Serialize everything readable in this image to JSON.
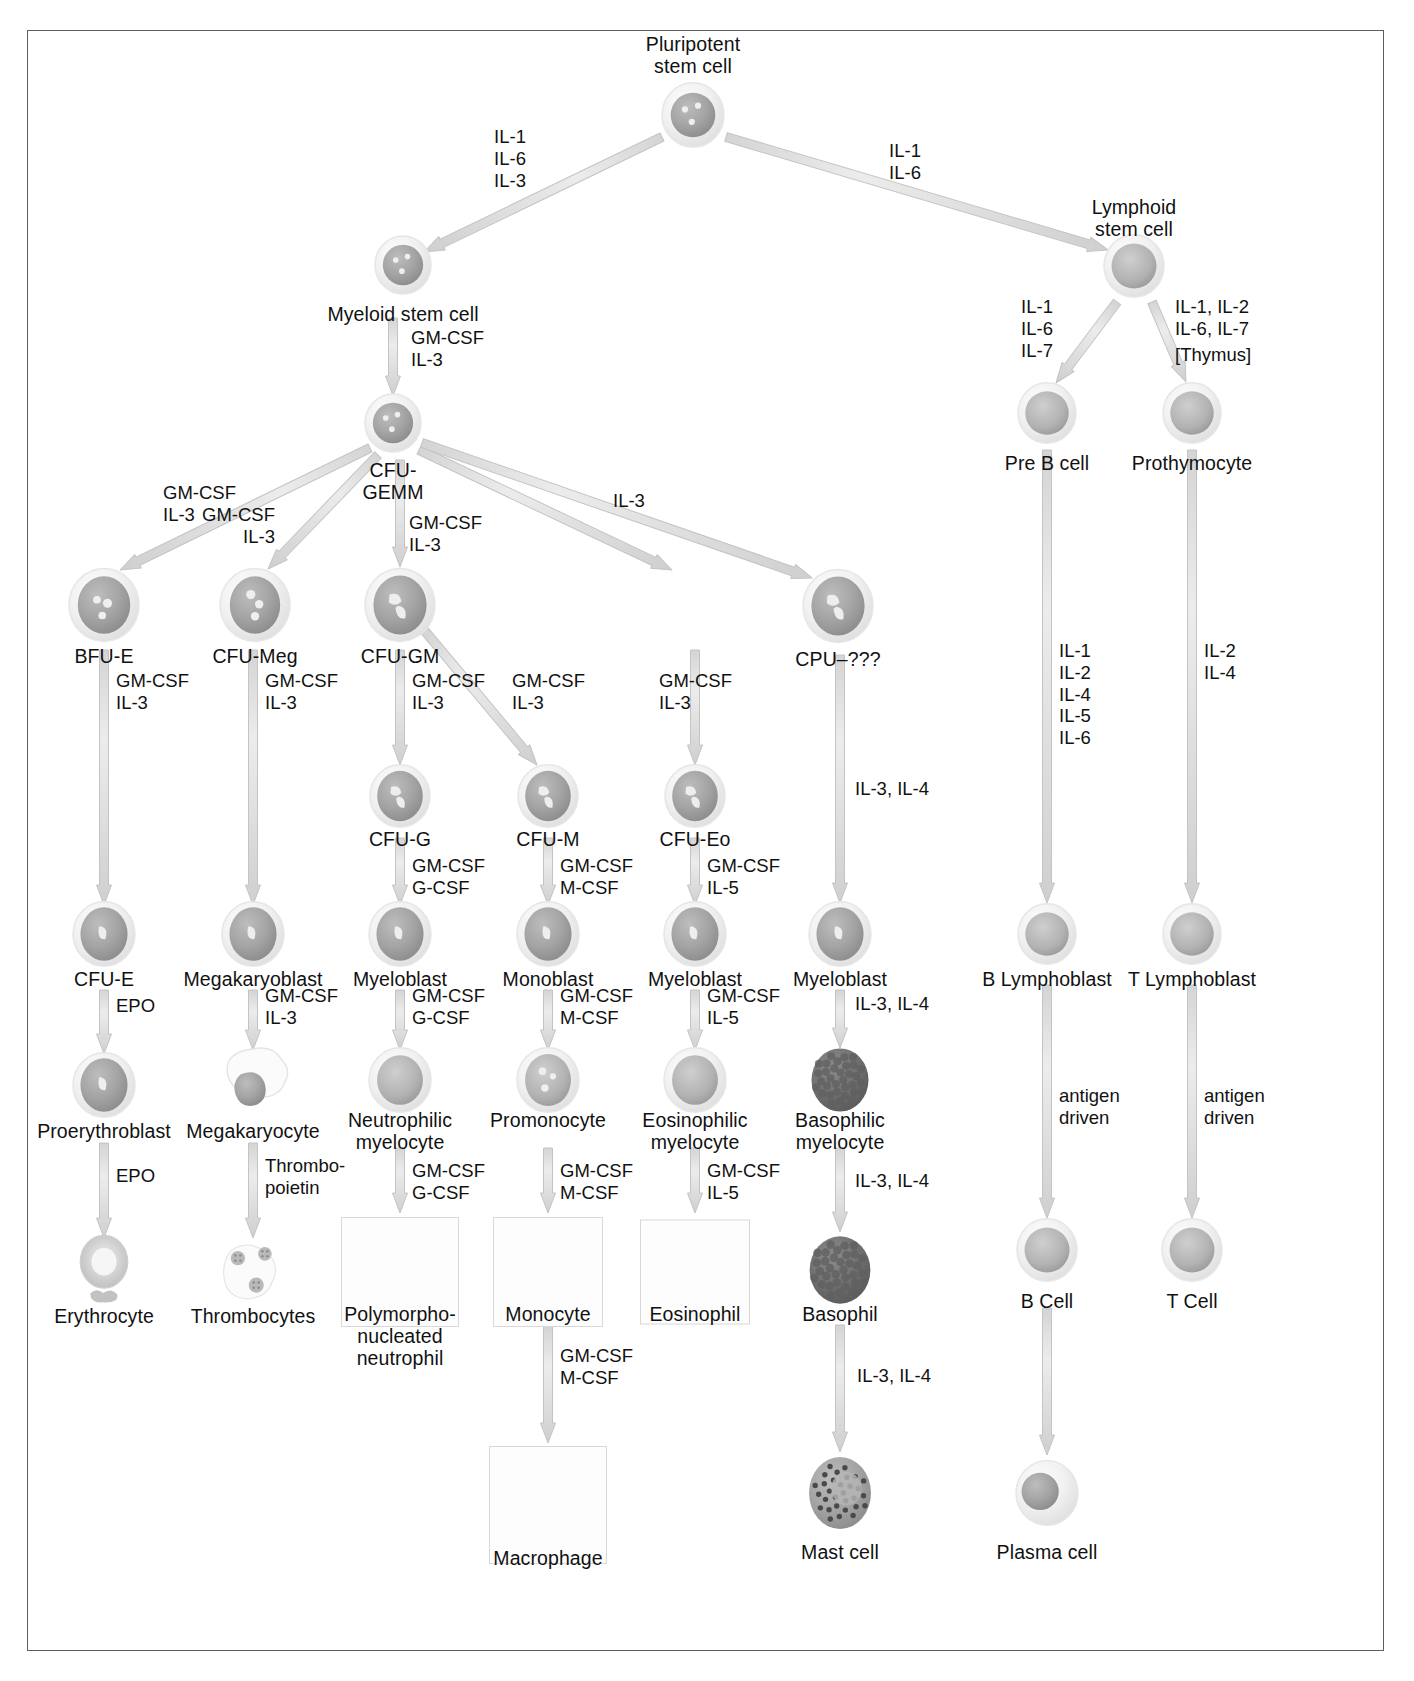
{
  "figure": {
    "frame_border_color": "#5a5f63",
    "background_color": "#ffffff"
  },
  "palette": {
    "cell_outer": "#efefef",
    "cell_ring": "#dcdcdc",
    "nucleus": "#9d9d9d",
    "nucleus_light": "#b8b8b8",
    "granule_dark": "#6e6e6e",
    "arrow_fill": "#e2e2e2",
    "arrow_stroke": "#c4c4c4",
    "text": "#111111"
  },
  "nodes": [
    {
      "id": "pluripotent",
      "label": "Pluripotent\nstem cell",
      "x": 693,
      "y": 117,
      "label_x": 693,
      "label_y": 33,
      "kind": "stem3",
      "r": 31
    },
    {
      "id": "myeloid",
      "label": "Myeloid stem cell",
      "x": 403,
      "y": 267,
      "label_x": 403,
      "label_y": 303,
      "kind": "stem3",
      "r": 28
    },
    {
      "id": "lymphoid",
      "label": "Lymphoid\nstem cell",
      "x": 1134,
      "y": 268,
      "label_x": 1134,
      "label_y": 196,
      "kind": "plain",
      "r": 30
    },
    {
      "id": "cfu-gemm",
      "label": "CFU-\nGEMM",
      "x": 393,
      "y": 425,
      "label_x": 393,
      "label_y": 459,
      "kind": "stem3",
      "r": 28
    },
    {
      "id": "pre-b",
      "label": "Pre B cell",
      "x": 1047,
      "y": 415,
      "label_x": 1047,
      "label_y": 452,
      "kind": "plain",
      "r": 29
    },
    {
      "id": "prothymocyte",
      "label": "Prothymocyte",
      "x": 1192,
      "y": 415,
      "label_x": 1192,
      "label_y": 452,
      "kind": "plain",
      "r": 29
    },
    {
      "id": "bfu-e",
      "label": "BFU-E",
      "x": 104,
      "y": 607,
      "label_x": 104,
      "label_y": 645,
      "kind": "blast2",
      "r": 35
    },
    {
      "id": "cfu-meg",
      "label": "CFU-Meg",
      "x": 255,
      "y": 607,
      "label_x": 255,
      "label_y": 645,
      "kind": "blast3",
      "r": 35
    },
    {
      "id": "cfu-gm",
      "label": "CFU-GM",
      "x": 400,
      "y": 607,
      "label_x": 400,
      "label_y": 645,
      "kind": "blastc",
      "r": 35
    },
    {
      "id": "cpu-unknown",
      "label": "CPU–???",
      "x": 838,
      "y": 608,
      "label_x": 838,
      "label_y": 648,
      "kind": "blastc",
      "r": 35
    },
    {
      "id": "cfu-g",
      "label": "CFU-G",
      "x": 400,
      "y": 798,
      "label_x": 400,
      "label_y": 828,
      "kind": "blastc",
      "r": 30
    },
    {
      "id": "cfu-m",
      "label": "CFU-M",
      "x": 548,
      "y": 798,
      "label_x": 548,
      "label_y": 828,
      "kind": "blastc",
      "r": 30
    },
    {
      "id": "cfu-eo",
      "label": "CFU-Eo",
      "x": 695,
      "y": 798,
      "label_x": 695,
      "label_y": 828,
      "kind": "blastc",
      "r": 30
    },
    {
      "id": "cfu-e",
      "label": "CFU-E",
      "x": 104,
      "y": 936,
      "label_x": 104,
      "label_y": 968,
      "kind": "blast1",
      "r": 31
    },
    {
      "id": "megakaryoblast",
      "label": "Megakaryoblast",
      "x": 253,
      "y": 936,
      "label_x": 253,
      "label_y": 968,
      "kind": "blast1",
      "r": 31
    },
    {
      "id": "myeloblast-g",
      "label": "Myeloblast",
      "x": 400,
      "y": 936,
      "label_x": 400,
      "label_y": 968,
      "kind": "blast1",
      "r": 31
    },
    {
      "id": "monoblast",
      "label": "Monoblast",
      "x": 548,
      "y": 936,
      "label_x": 548,
      "label_y": 968,
      "kind": "blast1",
      "r": 31
    },
    {
      "id": "myeloblast-eo",
      "label": "Myeloblast",
      "x": 695,
      "y": 936,
      "label_x": 695,
      "label_y": 968,
      "kind": "blast1",
      "r": 31
    },
    {
      "id": "myeloblast-ba",
      "label": "Myeloblast",
      "x": 840,
      "y": 936,
      "label_x": 840,
      "label_y": 968,
      "kind": "blast1",
      "r": 31
    },
    {
      "id": "b-lymphoblast",
      "label": "B Lymphoblast",
      "x": 1047,
      "y": 936,
      "label_x": 1047,
      "label_y": 968,
      "kind": "plain",
      "r": 29
    },
    {
      "id": "t-lymphoblast",
      "label": "T Lymphoblast",
      "x": 1192,
      "y": 936,
      "label_x": 1192,
      "label_y": 968,
      "kind": "plain",
      "r": 29
    },
    {
      "id": "proerythroblast",
      "label": "Proerythroblast",
      "x": 104,
      "y": 1087,
      "label_x": 104,
      "label_y": 1120,
      "kind": "blast1",
      "r": 31
    },
    {
      "id": "megakaryocyte",
      "label": "Megakaryocyte",
      "x": 253,
      "y": 1087,
      "label_x": 253,
      "label_y": 1120,
      "kind": "mega",
      "r": 36
    },
    {
      "id": "neutrophilic",
      "label": "Neutrophilic\nmyelocyte",
      "x": 400,
      "y": 1082,
      "label_x": 400,
      "label_y": 1109,
      "kind": "plainbig",
      "r": 31
    },
    {
      "id": "promonocyte",
      "label": "Promonocyte",
      "x": 548,
      "y": 1082,
      "label_x": 548,
      "label_y": 1109,
      "kind": "promono",
      "r": 31
    },
    {
      "id": "eosinophilic",
      "label": "Eosinophilic\nmyelocyte",
      "x": 695,
      "y": 1082,
      "label_x": 695,
      "label_y": 1109,
      "kind": "plainbig",
      "r": 31
    },
    {
      "id": "basophilic",
      "label": "Basophilic\nmyelocyte",
      "x": 840,
      "y": 1082,
      "label_x": 840,
      "label_y": 1109,
      "kind": "granular",
      "r": 31
    },
    {
      "id": "erythrocyte",
      "label": "Erythrocyte",
      "x": 104,
      "y": 1272,
      "label_x": 104,
      "label_y": 1305,
      "kind": "rbc",
      "r": 33
    },
    {
      "id": "thrombocytes",
      "label": "Thrombocytes",
      "x": 253,
      "y": 1272,
      "label_x": 253,
      "label_y": 1305,
      "kind": "platelets",
      "r": 36
    },
    {
      "id": "pmn",
      "label": "Polymorpho-\nnucleated\nneutrophil",
      "x": 400,
      "y": 1272,
      "label_x": 400,
      "label_y": 1303,
      "kind": "neutrophil",
      "r": 33
    },
    {
      "id": "monocyte",
      "label": "Monocyte",
      "x": 548,
      "y": 1272,
      "label_x": 548,
      "label_y": 1303,
      "kind": "monocyte",
      "r": 33
    },
    {
      "id": "eosinophil",
      "label": "Eosinophil",
      "x": 695,
      "y": 1272,
      "label_x": 695,
      "label_y": 1303,
      "kind": "eosinophil",
      "r": 33
    },
    {
      "id": "basophil",
      "label": "Basophil",
      "x": 840,
      "y": 1272,
      "label_x": 840,
      "label_y": 1303,
      "kind": "granular",
      "r": 33
    },
    {
      "id": "b-cell",
      "label": "B Cell",
      "x": 1047,
      "y": 1252,
      "label_x": 1047,
      "label_y": 1290,
      "kind": "plain",
      "r": 30
    },
    {
      "id": "t-cell",
      "label": "T Cell",
      "x": 1192,
      "y": 1252,
      "label_x": 1192,
      "label_y": 1290,
      "kind": "plain",
      "r": 30
    },
    {
      "id": "macrophage",
      "label": "Macrophage",
      "x": 548,
      "y": 1507,
      "label_x": 548,
      "label_y": 1547,
      "kind": "macrophage",
      "r": 38
    },
    {
      "id": "mast-cell",
      "label": "Mast cell",
      "x": 840,
      "y": 1495,
      "label_x": 840,
      "label_y": 1541,
      "kind": "mast",
      "r": 36
    },
    {
      "id": "plasma-cell",
      "label": "Plasma cell",
      "x": 1047,
      "y": 1495,
      "label_x": 1047,
      "label_y": 1541,
      "kind": "plasma",
      "r": 31
    }
  ],
  "boxes": [
    {
      "id": "box-pmn",
      "x": 400,
      "y": 1272,
      "w": 118,
      "h": 110
    },
    {
      "id": "box-monocyte",
      "x": 548,
      "y": 1272,
      "w": 110,
      "h": 110
    },
    {
      "id": "box-eosinophil",
      "x": 695,
      "y": 1272,
      "w": 110,
      "h": 105
    },
    {
      "id": "box-macrophage",
      "x": 548,
      "y": 1505,
      "w": 118,
      "h": 118
    }
  ],
  "arrows": [
    {
      "id": "a-pluri-myeloid",
      "x1": 662,
      "y1": 137,
      "x2": 424,
      "y2": 252
    },
    {
      "id": "a-pluri-lymphoid",
      "x1": 726,
      "y1": 137,
      "x2": 1108,
      "y2": 250
    },
    {
      "id": "a-myeloid-gemm",
      "x1": 393,
      "y1": 318,
      "x2": 393,
      "y2": 396
    },
    {
      "id": "a-lymph-preb",
      "x1": 1117,
      "y1": 302,
      "x2": 1056,
      "y2": 383
    },
    {
      "id": "a-lymph-prothy",
      "x1": 1152,
      "y1": 302,
      "x2": 1186,
      "y2": 382
    },
    {
      "id": "a-gemm-bfue",
      "x1": 370,
      "y1": 448,
      "x2": 120,
      "y2": 570
    },
    {
      "id": "a-gemm-cfumeg",
      "x1": 378,
      "y1": 455,
      "x2": 268,
      "y2": 569
    },
    {
      "id": "a-gemm-cfugm",
      "x1": 400,
      "y1": 460,
      "x2": 400,
      "y2": 567
    },
    {
      "id": "a-gemm-eo",
      "x1": 419,
      "y1": 450,
      "x2": 672,
      "y2": 570
    },
    {
      "id": "a-gemm-cpu",
      "x1": 422,
      "y1": 443,
      "x2": 812,
      "y2": 578
    },
    {
      "id": "a-cfugm-cfug",
      "x1": 400,
      "y1": 650,
      "x2": 400,
      "y2": 765
    },
    {
      "id": "a-cfugm-cfum",
      "x1": 424,
      "y1": 630,
      "x2": 537,
      "y2": 765
    },
    {
      "id": "a-cfueo-sub",
      "x1": 695,
      "y1": 650,
      "x2": 695,
      "y2": 765
    },
    {
      "id": "a-bfue-cfue",
      "x1": 104,
      "y1": 650,
      "x2": 104,
      "y2": 905
    },
    {
      "id": "a-cfumeg-megablast",
      "x1": 253,
      "y1": 650,
      "x2": 253,
      "y2": 905
    },
    {
      "id": "a-cfug-myeloblast",
      "x1": 400,
      "y1": 838,
      "x2": 400,
      "y2": 905
    },
    {
      "id": "a-cfum-monoblast",
      "x1": 548,
      "y1": 838,
      "x2": 548,
      "y2": 905
    },
    {
      "id": "a-cfueo-myeloblast",
      "x1": 695,
      "y1": 838,
      "x2": 695,
      "y2": 905
    },
    {
      "id": "a-cpu-myeloblast",
      "x1": 840,
      "y1": 655,
      "x2": 840,
      "y2": 903
    },
    {
      "id": "a-preb-blympho",
      "x1": 1047,
      "y1": 450,
      "x2": 1047,
      "y2": 903
    },
    {
      "id": "a-prothy-tlympho",
      "x1": 1192,
      "y1": 450,
      "x2": 1192,
      "y2": 903
    },
    {
      "id": "a-cfue-proery",
      "x1": 104,
      "y1": 990,
      "x2": 104,
      "y2": 1054
    },
    {
      "id": "a-megablast-megacyte",
      "x1": 253,
      "y1": 990,
      "x2": 253,
      "y2": 1050
    },
    {
      "id": "a-myeloblast-neutro",
      "x1": 400,
      "y1": 990,
      "x2": 400,
      "y2": 1050
    },
    {
      "id": "a-monoblast-promono",
      "x1": 548,
      "y1": 990,
      "x2": 548,
      "y2": 1050
    },
    {
      "id": "a-myeloblast-eosino",
      "x1": 695,
      "y1": 990,
      "x2": 695,
      "y2": 1050
    },
    {
      "id": "a-myeloblast-baso",
      "x1": 840,
      "y1": 990,
      "x2": 840,
      "y2": 1048
    },
    {
      "id": "a-proery-eryth",
      "x1": 104,
      "y1": 1143,
      "x2": 104,
      "y2": 1238
    },
    {
      "id": "a-megacyte-thrombo",
      "x1": 253,
      "y1": 1143,
      "x2": 253,
      "y2": 1238
    },
    {
      "id": "a-neutro-pmn",
      "x1": 400,
      "y1": 1148,
      "x2": 400,
      "y2": 1213
    },
    {
      "id": "a-promono-monocyte",
      "x1": 548,
      "y1": 1148,
      "x2": 548,
      "y2": 1213
    },
    {
      "id": "a-eosino-eosinophil",
      "x1": 695,
      "y1": 1148,
      "x2": 695,
      "y2": 1213
    },
    {
      "id": "a-baso-basophil",
      "x1": 840,
      "y1": 1148,
      "x2": 840,
      "y2": 1232
    },
    {
      "id": "a-blympho-bcell",
      "x1": 1047,
      "y1": 985,
      "x2": 1047,
      "y2": 1218
    },
    {
      "id": "a-tlympho-tcell",
      "x1": 1192,
      "y1": 985,
      "x2": 1192,
      "y2": 1218
    },
    {
      "id": "a-monocyte-macro",
      "x1": 548,
      "y1": 1325,
      "x2": 548,
      "y2": 1443
    },
    {
      "id": "a-basophil-mast",
      "x1": 840,
      "y1": 1325,
      "x2": 840,
      "y2": 1452
    },
    {
      "id": "a-bcell-plasma",
      "x1": 1047,
      "y1": 1308,
      "x2": 1047,
      "y2": 1455
    }
  ],
  "cytokine_labels": [
    {
      "id": "cy-pluri-myeloid",
      "text": "IL-1\nIL-6\nIL-3",
      "x": 510,
      "y": 126,
      "align": "c"
    },
    {
      "id": "cy-pluri-lymphoid",
      "text": "IL-1\nIL-6",
      "x": 905,
      "y": 140,
      "align": "c"
    },
    {
      "id": "cy-myeloid-gemm",
      "text": "GM-CSF\nIL-3",
      "x": 411,
      "y": 327,
      "align": "l"
    },
    {
      "id": "cy-lymph-preb",
      "text": "IL-1\nIL-6\nIL-7",
      "x": 1053,
      "y": 296,
      "align": "r"
    },
    {
      "id": "cy-lymph-prothy",
      "text": "IL-1, IL-2\nIL-6, IL-7",
      "x": 1175,
      "y": 296,
      "align": "l"
    },
    {
      "id": "cy-thymus",
      "text": "[Thymus]",
      "x": 1175,
      "y": 344,
      "align": "l"
    },
    {
      "id": "cy-gemm-bfue",
      "text": "GM-CSF\nIL-3",
      "x": 163,
      "y": 482,
      "align": "l"
    },
    {
      "id": "cy-gemm-cfumeg",
      "text": "GM-CSF\nIL-3",
      "x": 275,
      "y": 504,
      "align": "r"
    },
    {
      "id": "cy-gemm-cfugm",
      "text": "GM-CSF\nIL-3",
      "x": 409,
      "y": 512,
      "align": "l"
    },
    {
      "id": "cy-gemm-cpu",
      "text": "IL-3",
      "x": 613,
      "y": 490,
      "align": "l"
    },
    {
      "id": "cy-bfue-cfue",
      "text": "GM-CSF\nIL-3",
      "x": 116,
      "y": 670,
      "align": "l"
    },
    {
      "id": "cy-cfumeg-mb",
      "text": "GM-CSF\nIL-3",
      "x": 265,
      "y": 670,
      "align": "l"
    },
    {
      "id": "cy-cfugm-cfug",
      "text": "GM-CSF\nIL-3",
      "x": 412,
      "y": 670,
      "align": "l"
    },
    {
      "id": "cy-cfugm-cfum",
      "text": "GM-CSF\nIL-3",
      "x": 512,
      "y": 670,
      "align": "l"
    },
    {
      "id": "cy-cfueo",
      "text": "GM-CSF\nIL-3",
      "x": 659,
      "y": 670,
      "align": "l"
    },
    {
      "id": "cy-cfug-g",
      "text": "GM-CSF\nG-CSF",
      "x": 412,
      "y": 855,
      "align": "l"
    },
    {
      "id": "cy-cfum-m",
      "text": "GM-CSF\nM-CSF",
      "x": 560,
      "y": 855,
      "align": "l"
    },
    {
      "id": "cy-cfueo-eo",
      "text": "GM-CSF\nIL-5",
      "x": 707,
      "y": 855,
      "align": "l"
    },
    {
      "id": "cy-cpu-myelo",
      "text": "IL-3, IL-4",
      "x": 855,
      "y": 778,
      "align": "l"
    },
    {
      "id": "cy-preb-blympho",
      "text": "IL-1\nIL-2\nIL-4\nIL-5\nIL-6",
      "x": 1059,
      "y": 640,
      "align": "l"
    },
    {
      "id": "cy-prothy-tlympho",
      "text": "IL-2\nIL-4",
      "x": 1204,
      "y": 640,
      "align": "l"
    },
    {
      "id": "cy-cfue-epo",
      "text": "EPO",
      "x": 116,
      "y": 995,
      "align": "l"
    },
    {
      "id": "cy-megablast",
      "text": "GM-CSF\nIL-3",
      "x": 265,
      "y": 985,
      "align": "l"
    },
    {
      "id": "cy-myeloblast-g",
      "text": "GM-CSF\nG-CSF",
      "x": 412,
      "y": 985,
      "align": "l"
    },
    {
      "id": "cy-monoblast",
      "text": "GM-CSF\nM-CSF",
      "x": 560,
      "y": 985,
      "align": "l"
    },
    {
      "id": "cy-myeloblast-eo",
      "text": "GM-CSF\nIL-5",
      "x": 707,
      "y": 985,
      "align": "l"
    },
    {
      "id": "cy-myeloblast-ba",
      "text": "IL-3, IL-4",
      "x": 855,
      "y": 993,
      "align": "l"
    },
    {
      "id": "cy-proery-epo",
      "text": "EPO",
      "x": 116,
      "y": 1165,
      "align": "l"
    },
    {
      "id": "cy-thrombopoietin",
      "text": "Thrombo-\npoietin",
      "x": 265,
      "y": 1155,
      "align": "l"
    },
    {
      "id": "cy-neutro",
      "text": "GM-CSF\nG-CSF",
      "x": 412,
      "y": 1160,
      "align": "l"
    },
    {
      "id": "cy-promono",
      "text": "GM-CSF\nM-CSF",
      "x": 560,
      "y": 1160,
      "align": "l"
    },
    {
      "id": "cy-eosino",
      "text": "GM-CSF\nIL-5",
      "x": 707,
      "y": 1160,
      "align": "l"
    },
    {
      "id": "cy-baso",
      "text": "IL-3, IL-4",
      "x": 855,
      "y": 1170,
      "align": "l"
    },
    {
      "id": "cy-blympho-antigen",
      "text": "antigen\ndriven",
      "x": 1059,
      "y": 1085,
      "align": "l"
    },
    {
      "id": "cy-tlympho-antigen",
      "text": "antigen\ndriven",
      "x": 1204,
      "y": 1085,
      "align": "l"
    },
    {
      "id": "cy-monocyte-macro",
      "text": "GM-CSF\nM-CSF",
      "x": 560,
      "y": 1345,
      "align": "l"
    },
    {
      "id": "cy-basophil-mast",
      "text": "IL-3, IL-4",
      "x": 857,
      "y": 1365,
      "align": "l"
    }
  ]
}
